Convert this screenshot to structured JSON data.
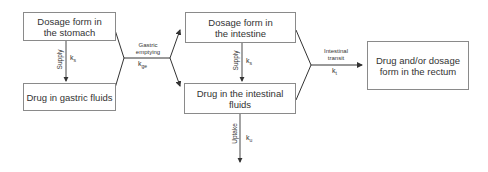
{
  "diagram": {
    "boxes": {
      "stomach_form": "Dosage form in the stomach",
      "gastric_fluids": "Drug in gastric fluids",
      "intestine_form": "Dosage form in the intestine",
      "intestinal_fluids": "Drug in the intestinal fluids",
      "rectum": "Drug and/or dosage form in the rectum"
    },
    "processes": {
      "supply_stomach": {
        "label": "Supply",
        "rate": "k",
        "rate_sub": "s"
      },
      "gastric_emptying": {
        "label_line1": "Gastric",
        "label_line2": "emptying",
        "rate": "k",
        "rate_sub": "ge"
      },
      "supply_intestine": {
        "label": "Supply",
        "rate": "k",
        "rate_sub": "s"
      },
      "intestinal_transit": {
        "label_line1": "Intestinal",
        "label_line2": "transit",
        "rate": "k",
        "rate_sub": "t"
      },
      "uptake": {
        "label": "Uptake",
        "rate": "k",
        "rate_sub": "u"
      }
    },
    "colors": {
      "line": "#333333",
      "box_border": "#8a8a8a"
    }
  }
}
